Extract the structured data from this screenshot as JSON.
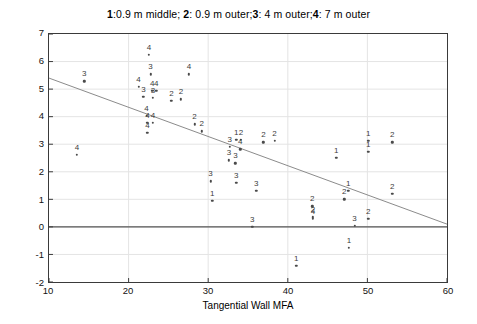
{
  "chart_data": {
    "type": "scatter",
    "title": "1:0.9 m middle; 2: 0.9 m outer;3: 4 m outer;4: 7 m outer",
    "title_parts": [
      {
        "text": "1",
        "bold": true
      },
      {
        "text": ":0.9 m middle; ",
        "bold": false
      },
      {
        "text": "2",
        "bold": true
      },
      {
        "text": ": 0.9 m outer;",
        "bold": false
      },
      {
        "text": "3",
        "bold": true
      },
      {
        "text": ": 4 m outer;",
        "bold": false
      },
      {
        "text": "4",
        "bold": true
      },
      {
        "text": ": 7 m outer",
        "bold": false
      }
    ],
    "xlabel": "Tangential Wall MFA",
    "ylabel": "Radial Compression Increased Tangential MFA",
    "xlim": [
      10,
      60
    ],
    "ylim": [
      -2,
      7
    ],
    "xticks": [
      10,
      20,
      30,
      40,
      50,
      60
    ],
    "xtick_labels": [
      "10",
      "20",
      "30",
      "40",
      "50",
      "60"
    ],
    "yticks": [
      -2,
      -1,
      0,
      1,
      2,
      3,
      4,
      5,
      6,
      7
    ],
    "ytick_labels": [
      "-2",
      "-1",
      "0",
      "1",
      "2",
      "3",
      "4",
      "5",
      "6",
      "7"
    ],
    "grid": true,
    "grid_color": "#e4e4e4",
    "marker_color": "#4a4a4a",
    "label_color": "#3c3c3c",
    "zero_line": {
      "y": 0,
      "color": "#555555",
      "width": 1.3
    },
    "trend_line": {
      "label": "linear fit",
      "color": "#8a8a8a",
      "x": [
        10,
        60
      ],
      "y": [
        5.4,
        0.1
      ]
    },
    "legend_position": "title",
    "series": [
      {
        "name": "1",
        "label": "0.9 m middle",
        "points": [
          [
            30.4,
            1.0
          ],
          [
            33.4,
            3.2
          ],
          [
            40.9,
            -1.35
          ],
          [
            45.9,
            2.55
          ],
          [
            47.4,
            1.35
          ],
          [
            47.5,
            -0.7
          ],
          [
            49.9,
            3.15
          ],
          [
            49.9,
            2.75
          ]
        ]
      },
      {
        "name": "2",
        "label": "0.9 m outer",
        "points": [
          [
            25.3,
            4.6
          ],
          [
            26.5,
            4.65
          ],
          [
            28.2,
            3.75
          ],
          [
            29.1,
            3.5
          ],
          [
            34.0,
            3.2
          ],
          [
            36.8,
            3.1
          ],
          [
            38.2,
            3.15
          ],
          [
            42.9,
            0.8
          ],
          [
            43.0,
            0.4
          ],
          [
            46.9,
            1.05
          ],
          [
            52.9,
            3.1
          ],
          [
            52.9,
            1.25
          ],
          [
            49.9,
            0.35
          ]
        ]
      },
      {
        "name": "3",
        "label": "4 m outer",
        "points": [
          [
            14.4,
            5.3
          ],
          [
            21.8,
            4.75
          ],
          [
            23.0,
            4.7
          ],
          [
            22.7,
            5.55
          ],
          [
            30.2,
            1.7
          ],
          [
            32.6,
            2.95
          ],
          [
            32.5,
            2.45
          ],
          [
            33.3,
            2.35
          ],
          [
            33.4,
            1.65
          ],
          [
            35.9,
            1.35
          ],
          [
            35.4,
            0.05
          ],
          [
            48.2,
            0.1
          ]
        ]
      },
      {
        "name": "4",
        "label": "7 m outer",
        "points": [
          [
            13.5,
            2.65
          ],
          [
            21.2,
            5.1
          ],
          [
            22.5,
            6.25
          ],
          [
            22.9,
            4.95
          ],
          [
            23.4,
            4.95
          ],
          [
            22.2,
            4.05
          ],
          [
            22.3,
            3.8
          ],
          [
            22.3,
            3.45
          ],
          [
            23.0,
            3.8
          ],
          [
            27.5,
            5.55
          ],
          [
            33.9,
            2.85
          ],
          [
            43.0,
            0.35
          ]
        ]
      }
    ]
  },
  "geometry": {
    "plot_left": 48,
    "plot_top": 33,
    "plot_width": 400,
    "plot_height": 250
  }
}
